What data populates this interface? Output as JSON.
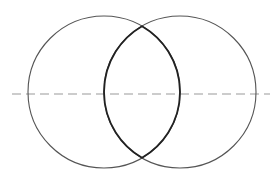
{
  "diagram": {
    "canvas": {
      "width": 274,
      "height": 184,
      "background": "#ffffff"
    },
    "circles": [
      {
        "name": "left-circle",
        "cx": 104,
        "cy": 92,
        "r": 76,
        "stroke": "#555555",
        "stroke_width": 1.1
      },
      {
        "name": "right-circle",
        "cx": 180,
        "cy": 92,
        "r": 76,
        "stroke": "#555555",
        "stroke_width": 1.1
      }
    ],
    "lens": {
      "name": "intersection-lens",
      "stroke": "#222222",
      "stroke_width": 1.8
    },
    "axis_line": {
      "name": "center-axis-dashed-line",
      "x1": 12,
      "y1": 94,
      "x2": 270,
      "y2": 94,
      "stroke": "#999999",
      "stroke_width": 1.2,
      "dasharray": "9 5"
    }
  }
}
